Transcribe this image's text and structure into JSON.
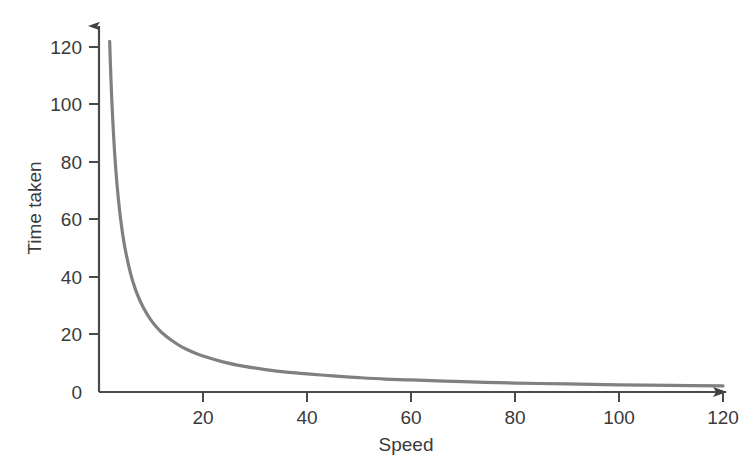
{
  "chart_data": {
    "type": "line",
    "title": "",
    "subtitle": "",
    "xlabel": "Speed",
    "ylabel": "Time taken",
    "xlim": [
      0,
      126
    ],
    "ylim": [
      0,
      130
    ],
    "xticks": [
      20,
      40,
      60,
      80,
      100,
      120
    ],
    "yticks": [
      0,
      20,
      40,
      60,
      80,
      100,
      120
    ],
    "xtick_labels": [
      "20",
      "40",
      "60",
      "80",
      "100",
      "120"
    ],
    "ytick_labels": [
      "0",
      "20",
      "40",
      "60",
      "80",
      "100",
      "120"
    ],
    "grid": false,
    "legend": false,
    "legend_position": "none",
    "relationship": "inverse proportion, y = k / x, k ≈ 250",
    "series": [
      {
        "name": "Time taken vs Speed",
        "color": "#808080",
        "line_width": 3.2,
        "x": [
          2.05,
          2.3,
          2.6,
          3.0,
          3.5,
          4.0,
          4.5,
          5.0,
          6.0,
          7.0,
          8.0,
          9.0,
          10.0,
          11.0,
          12.0,
          14.0,
          16.0,
          18.0,
          20.0,
          24.0,
          28.0,
          32.0,
          36.0,
          40.0,
          45.0,
          50.0,
          55.0,
          60.0,
          70.0,
          80.0,
          90.0,
          100.0,
          110.0,
          120.0
        ],
        "y": [
          122.0,
          108.7,
          96.2,
          83.3,
          71.4,
          62.5,
          55.6,
          50.0,
          41.7,
          35.7,
          31.3,
          27.8,
          25.0,
          22.7,
          20.8,
          17.9,
          15.6,
          13.9,
          12.5,
          10.4,
          8.9,
          7.8,
          6.9,
          6.3,
          5.6,
          5.0,
          4.5,
          4.2,
          3.6,
          3.1,
          2.8,
          2.5,
          2.3,
          2.1
        ]
      }
    ],
    "axis_style": {
      "x_axis_arrow": true,
      "y_axis_arrow": true,
      "axis_color": "#4a4a4a",
      "spines": [
        "left",
        "bottom"
      ]
    },
    "background_color": "#ffffff"
  },
  "axes": {
    "x_title": "Speed",
    "y_title": "Time taken"
  },
  "x_ticks": [
    {
      "label": "20"
    },
    {
      "label": "40"
    },
    {
      "label": "60"
    },
    {
      "label": "80"
    },
    {
      "label": "100"
    },
    {
      "label": "120"
    }
  ],
  "y_ticks": [
    {
      "label": "120"
    },
    {
      "label": "100"
    },
    {
      "label": "80"
    },
    {
      "label": "60"
    },
    {
      "label": "40"
    },
    {
      "label": "20"
    },
    {
      "label": "0"
    }
  ]
}
